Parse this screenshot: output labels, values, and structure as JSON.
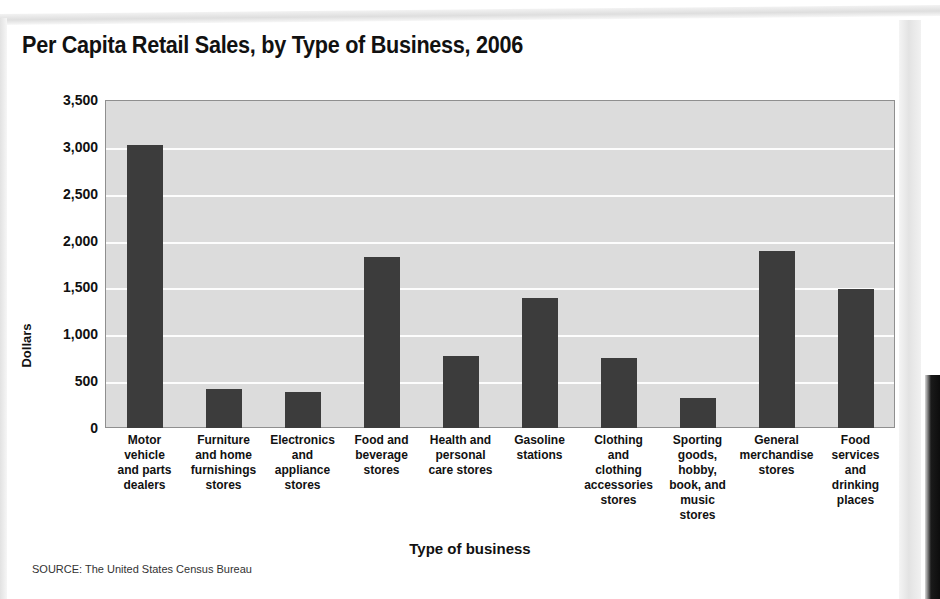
{
  "chart_data": {
    "type": "bar",
    "title": "Per Capita Retail Sales, by Type of Business, 2006",
    "xlabel": "Type of business",
    "ylabel": "Dollars",
    "ylim": [
      0,
      3500
    ],
    "yticks": [
      "0",
      "500",
      "1,000",
      "1,500",
      "2,000",
      "2,500",
      "3,000",
      "3,500"
    ],
    "ytick_values": [
      0,
      500,
      1000,
      1500,
      2000,
      2500,
      3000,
      3500
    ],
    "grid": true,
    "legend": "none",
    "categories": [
      "Motor\nvehicle\nand parts\ndealers",
      "Furniture\nand home\nfurnishings\nstores",
      "Electronics\nand\nappliance\nstores",
      "Food and\nbeverage\nstores",
      "Health and\npersonal\ncare stores",
      "Gasoline\nstations",
      "Clothing\nand\nclothing\naccessories\nstores",
      "Sporting\ngoods,\nhobby,\nbook, and\nmusic\nstores",
      "General\nmerchandise\nstores",
      "Food\nservices\nand\ndrinking\nplaces"
    ],
    "values": [
      3020,
      420,
      385,
      1830,
      770,
      1390,
      750,
      320,
      1890,
      1480
    ],
    "bar_color": "#3c3c3c",
    "plot_background": "#dcdcdc",
    "gridline_color": "#fdfdfd"
  },
  "source": {
    "note": "SOURCE: The United States Census Bureau"
  }
}
